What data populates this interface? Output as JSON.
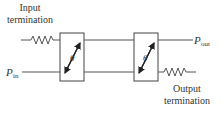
{
  "diagram": {
    "type": "cascaded variable phase shifters / couplers with terminations",
    "labels": {
      "input_termination_line1": "Input",
      "input_termination_line2": "termination",
      "output_termination_line1": "Output",
      "output_termination_line2": "termination",
      "p_in_main": "P",
      "p_in_sub": "in",
      "p_out_main": "P",
      "p_out_sub": "out",
      "theta_left": "θ",
      "theta_right": "θ"
    },
    "components": [
      {
        "id": "input-termination",
        "kind": "resistor",
        "port": "top-left"
      },
      {
        "id": "coupler-left",
        "kind": "variable coupler",
        "param": "θ"
      },
      {
        "id": "coupler-right",
        "kind": "variable coupler",
        "param": "θ"
      },
      {
        "id": "output-termination",
        "kind": "resistor",
        "port": "bottom-right"
      }
    ],
    "colors": {
      "line": "#555555",
      "text": "#333333",
      "background": "#ffffff"
    }
  }
}
